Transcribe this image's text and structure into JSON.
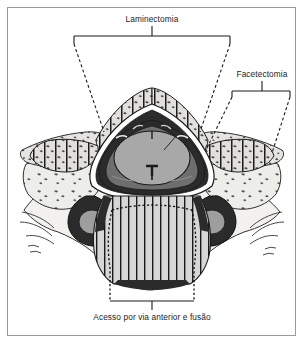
{
  "figure": {
    "background_color": "#ffffff",
    "frame_color": "#9a9a9a",
    "ink_color": "#1b1b1b"
  },
  "annotations": {
    "laminectomy": {
      "label": "Laminectomia",
      "position": "top-center",
      "bracket": "solid",
      "leader_style": "dashed",
      "targets": [
        "lamina-esquerda",
        "lamina-direita"
      ]
    },
    "facetectomy": {
      "label": "Facetectomia",
      "position": "top-right",
      "bracket": "solid",
      "leader_style": "dashed",
      "targets": [
        "faceta-articular-direita"
      ]
    },
    "anterior_access": {
      "label": "Acesso por via anterior e fusão",
      "position": "bottom-center",
      "bracket": "solid",
      "leader_style": "dotted",
      "targets": [
        "corpo-vertebral"
      ]
    }
  },
  "anatomy": {
    "regions": [
      {
        "name": "corpo-vertebral",
        "label": "Corpo vertebral",
        "fill": "#d9d9d9",
        "hatch": "vertical"
      },
      {
        "name": "medula-espinhal",
        "label": "Medula espinhal",
        "fill": "#a8a8a8",
        "hatch": "none"
      },
      {
        "name": "dura-mater",
        "label": "Dura-máter e espaço epidural",
        "fill": "#2b2b2b",
        "hatch": "none"
      },
      {
        "name": "lamina",
        "label": "Lâmina",
        "fill": "#d2d2d2",
        "hatch": "vertical-stipple"
      },
      {
        "name": "musculatura-paravertebral",
        "label": "Musculatura paravertebral",
        "fill": "#e8e8e8",
        "hatch": "stipple"
      },
      {
        "name": "processo-transverso",
        "label": "Processo transverso",
        "fill": "#9e9e9e",
        "hatch": "none"
      }
    ],
    "colors": {
      "bone_light": "#dcdcdc",
      "bone_mid": "#c9c9c9",
      "soft_tissue": "#ececec",
      "cord_gray": "#a8a8a8",
      "dura_dark": "#2b2b2b",
      "outline": "#111111"
    }
  }
}
